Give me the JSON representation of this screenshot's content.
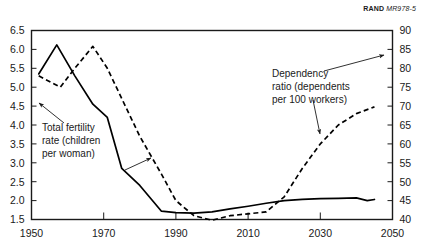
{
  "source": {
    "brand": "RAND",
    "document_id": "MR978-5"
  },
  "chart_data": {
    "type": "line",
    "title": "",
    "subtitle": "",
    "xlabel": "",
    "ylabel": "",
    "grid": false,
    "legend_position": "inline-annotations",
    "xlim": [
      1950,
      2050
    ],
    "x_ticks": [
      "1950",
      "1970",
      "1990",
      "2010",
      "2030",
      "2050"
    ],
    "x_tick_values": [
      1950,
      1970,
      1990,
      2010,
      2030,
      2050
    ],
    "axes": [
      {
        "id": "left",
        "label": "Total fertility rate (children per woman)",
        "ylim": [
          1.5,
          6.5
        ],
        "ticks": [
          "1.5",
          "2.0",
          "2.5",
          "3.0",
          "3.5",
          "4.0",
          "4.5",
          "5.0",
          "5.5",
          "6.0",
          "6.5"
        ],
        "tick_values": [
          1.5,
          2.0,
          2.5,
          3.0,
          3.5,
          4.0,
          4.5,
          5.0,
          5.5,
          6.0,
          6.5
        ]
      },
      {
        "id": "right",
        "label": "Dependency ratio (dependents per 100 workers)",
        "ylim": [
          40,
          90
        ],
        "ticks": [
          "40",
          "45",
          "50",
          "55",
          "60",
          "65",
          "70",
          "75",
          "80",
          "85",
          "90"
        ],
        "tick_values": [
          40,
          45,
          50,
          55,
          60,
          65,
          70,
          75,
          80,
          85,
          90
        ]
      }
    ],
    "series": [
      {
        "name": "Total fertility rate (children per woman)",
        "axis": "left",
        "style": "solid",
        "x": [
          1952,
          1957,
          1962,
          1967,
          1971,
          1975,
          1980,
          1986,
          1990,
          1995,
          2000,
          2005,
          2010,
          2015,
          2020,
          2025,
          2030,
          2035,
          2040,
          2043,
          2045
        ],
        "values": [
          5.35,
          6.12,
          5.3,
          4.55,
          4.2,
          2.85,
          2.4,
          1.72,
          1.68,
          1.67,
          1.7,
          1.78,
          1.85,
          1.93,
          2.0,
          2.03,
          2.05,
          2.06,
          2.07,
          2.0,
          2.03
        ]
      },
      {
        "name": "Dependency ratio (dependents per 100 workers)",
        "axis": "right",
        "style": "dashed",
        "x": [
          1952,
          1958,
          1962,
          1967,
          1971,
          1975,
          1980,
          1986,
          1990,
          1995,
          2000,
          2005,
          2010,
          2015,
          2020,
          2025,
          2030,
          2035,
          2040,
          2045
        ],
        "values": [
          78.0,
          75.0,
          80.0,
          85.8,
          80.0,
          72.0,
          62.0,
          52.0,
          45.0,
          41.0,
          39.8,
          41.0,
          41.5,
          42.0,
          46.0,
          53.5,
          60.0,
          65.0,
          68.0,
          69.8
        ]
      }
    ],
    "annotations": [
      {
        "id": "fertility-annotation",
        "text_lines": [
          "Total  fertility",
          "rate (children",
          "per  woman)"
        ],
        "target": "series-total-fertility-rate"
      },
      {
        "id": "dependency-annotation",
        "text_lines": [
          "Dependency",
          "ratio (dependents",
          "per 100 workers)"
        ],
        "target": "series-dependency-ratio"
      }
    ]
  }
}
